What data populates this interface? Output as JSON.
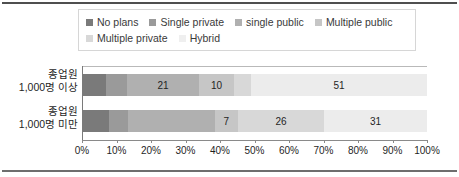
{
  "chart_data": {
    "type": "bar",
    "orientation": "horizontal",
    "stacked": true,
    "stacked_mode": "percent",
    "title": "",
    "subtitle": "",
    "xlabel": "",
    "ylabel": "",
    "xlim": [
      0,
      100
    ],
    "grid": false,
    "legend_position": "top",
    "categories": [
      "종업원\n1,000명 이상",
      "종업원\n1,000명 미만"
    ],
    "category_labels": [
      {
        "line1": "종업원",
        "line2": "1,000명 이상"
      },
      {
        "line1": "종업원",
        "line2": "1,000명 미만"
      }
    ],
    "series": [
      {
        "name": "No plans",
        "color": "#7a7a7a",
        "values": [
          7,
          8
        ]
      },
      {
        "name": "Single private",
        "color": "#9a9a9a",
        "values": [
          6,
          6
        ]
      },
      {
        "name": "single public",
        "color": "#b0b0b0",
        "values": [
          21,
          26
        ]
      },
      {
        "name": "Multiple public",
        "color": "#c6c6c6",
        "values": [
          10,
          7
        ]
      },
      {
        "name": "Multiple private",
        "color": "#d8d8d8",
        "values": [
          5,
          26
        ]
      },
      {
        "name": "Hybrid",
        "color": "#ececec",
        "values": [
          51,
          31
        ]
      }
    ],
    "visible_value_labels": [
      [
        "",
        "",
        "21",
        "10",
        "",
        "51"
      ],
      [
        "",
        "",
        "",
        "7",
        "26",
        "31"
      ]
    ],
    "xticks": [
      0,
      10,
      20,
      30,
      40,
      50,
      60,
      70,
      80,
      90,
      100
    ],
    "xticklabels": [
      "0%",
      "10%",
      "20%",
      "30%",
      "40%",
      "50%",
      "60%",
      "70%",
      "80%",
      "90%",
      "100%"
    ]
  },
  "legend": {
    "rows": [
      [
        {
          "label": "No plans",
          "color": "#7a7a7a"
        },
        {
          "label": "Single private",
          "color": "#9a9a9a"
        },
        {
          "label": "single public",
          "color": "#b0b0b0"
        },
        {
          "label": "Multiple public",
          "color": "#c6c6c6"
        }
      ],
      [
        {
          "label": "Multiple private",
          "color": "#d8d8d8"
        },
        {
          "label": "Hybrid",
          "color": "#efefef"
        }
      ]
    ]
  },
  "colors": {
    "background": "#ffffff",
    "rule": "#4f4f4f",
    "axis": "#8a8a8a",
    "text": "#1f1f1f"
  }
}
